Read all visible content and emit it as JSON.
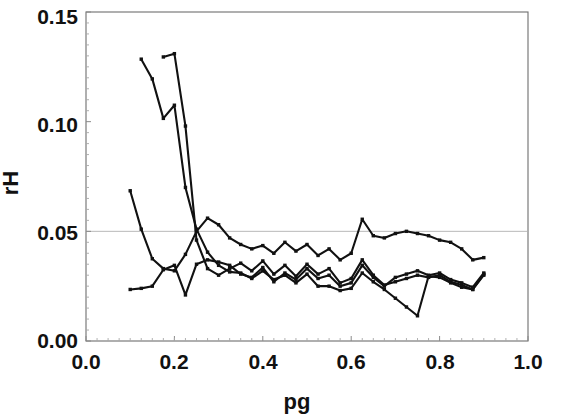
{
  "chart_data": {
    "type": "line",
    "title": "",
    "xlabel": "pg",
    "ylabel": "rH",
    "xlim": [
      0.0,
      1.0
    ],
    "ylim": [
      0.0,
      0.15
    ],
    "xticks": [
      "0.0",
      "0.2",
      "0.4",
      "0.6",
      "0.8",
      "1.0"
    ],
    "xtick_values": [
      0.0,
      0.2,
      0.4,
      0.6,
      0.8,
      1.0
    ],
    "yticks": [
      "0.00",
      "0.05",
      "0.10",
      "0.15"
    ],
    "ytick_values": [
      0.0,
      0.05,
      0.1,
      0.15
    ],
    "grid": "horizontal gridline at rH = 0.05",
    "gridline_values": [
      0.05
    ],
    "legend": "none",
    "marker": "small filled square",
    "line_color": "#111111",
    "x": [
      0.1,
      0.125,
      0.15,
      0.175,
      0.2,
      0.225,
      0.25,
      0.275,
      0.3,
      0.325,
      0.35,
      0.375,
      0.4,
      0.425,
      0.45,
      0.475,
      0.5,
      0.525,
      0.55,
      0.575,
      0.6,
      0.625,
      0.65,
      0.675,
      0.7,
      0.725,
      0.75,
      0.775,
      0.8,
      0.825,
      0.85,
      0.875,
      0.9
    ],
    "series": [
      {
        "name": "series-1",
        "values": [
          null,
          0.1285,
          0.1195,
          0.1015,
          0.1075,
          0.07,
          0.051,
          0.0405,
          0.0345,
          0.0315,
          0.031,
          0.0285,
          0.032,
          0.028,
          0.03,
          0.0265,
          0.0305,
          0.025,
          0.025,
          0.023,
          0.024,
          0.031,
          0.027,
          0.0235,
          0.0195,
          0.0155,
          0.0115,
          0.0295,
          0.029,
          0.0265,
          0.0245,
          0.0235,
          0.03
        ]
      },
      {
        "name": "series-2",
        "values": [
          null,
          null,
          null,
          0.1295,
          0.131,
          0.098,
          0.046,
          0.033,
          0.03,
          0.033,
          0.0355,
          0.032,
          0.0365,
          0.0305,
          0.0345,
          0.0295,
          0.035,
          0.0305,
          0.033,
          0.0265,
          0.0285,
          0.037,
          0.03,
          0.0255,
          0.027,
          0.0285,
          0.03,
          0.029,
          0.03,
          0.027,
          0.0255,
          0.0235,
          0.0305
        ]
      },
      {
        "name": "series-3",
        "values": [
          0.0685,
          0.051,
          0.0375,
          0.033,
          0.032,
          0.0395,
          0.05,
          0.056,
          0.053,
          0.047,
          0.044,
          0.042,
          0.0435,
          0.04,
          0.045,
          0.041,
          0.044,
          0.039,
          0.042,
          0.037,
          0.04,
          0.0555,
          0.048,
          0.047,
          0.049,
          0.05,
          0.049,
          0.048,
          0.046,
          0.045,
          0.042,
          0.037,
          0.038
        ]
      },
      {
        "name": "series-4",
        "values": [
          0.0235,
          0.024,
          0.025,
          0.0325,
          0.0345,
          0.021,
          0.035,
          0.037,
          0.036,
          0.0345,
          0.0305,
          0.029,
          0.0335,
          0.027,
          0.031,
          0.028,
          0.033,
          0.0285,
          0.03,
          0.025,
          0.0265,
          0.0345,
          0.029,
          0.025,
          0.029,
          0.0305,
          0.032,
          0.03,
          0.031,
          0.028,
          0.0265,
          0.0245,
          0.031
        ]
      }
    ]
  }
}
